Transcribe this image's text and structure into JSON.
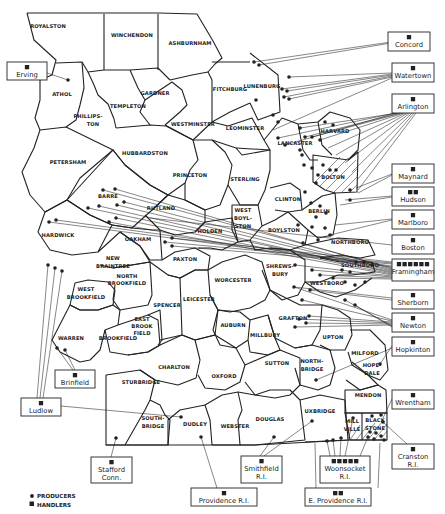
{
  "map": {
    "title": "",
    "towns": [
      {
        "name": "ROYALSTON",
        "x": 48,
        "y": 28
      },
      {
        "name": "WINCHENDON",
        "x": 132,
        "y": 37
      },
      {
        "name": "ASHBURNHAM",
        "x": 190,
        "y": 45
      },
      {
        "name": "ATHOL",
        "x": 62,
        "y": 96
      },
      {
        "name": "GARDNER",
        "x": 155,
        "y": 95
      },
      {
        "name": "TEMPLETON",
        "x": 128,
        "y": 108
      },
      {
        "name": "PHILLIPS-",
        "x": 88,
        "y": 118
      },
      {
        "name": "TON",
        "x": 93,
        "y": 126
      },
      {
        "name": "FITCHBURG",
        "x": 230,
        "y": 91
      },
      {
        "name": "LUNENBURG",
        "x": 262,
        "y": 88
      },
      {
        "name": "WESTMINSTER",
        "x": 193,
        "y": 126
      },
      {
        "name": "LEOMINSTER",
        "x": 245,
        "y": 130
      },
      {
        "name": "HARVARD",
        "x": 335,
        "y": 133
      },
      {
        "name": "PETERSHAM",
        "x": 68,
        "y": 164
      },
      {
        "name": "HUBBARDSTON",
        "x": 145,
        "y": 155
      },
      {
        "name": "LANCASTER",
        "x": 295,
        "y": 145
      },
      {
        "name": "PRINCETON",
        "x": 190,
        "y": 177
      },
      {
        "name": "STERLING",
        "x": 245,
        "y": 181
      },
      {
        "name": "BOLTON",
        "x": 333,
        "y": 179
      },
      {
        "name": "BARRE",
        "x": 108,
        "y": 198
      },
      {
        "name": "RUTLAND",
        "x": 161,
        "y": 210
      },
      {
        "name": "CLINTON",
        "x": 288,
        "y": 201
      },
      {
        "name": "WEST",
        "x": 243,
        "y": 212
      },
      {
        "name": "BOYL-",
        "x": 243,
        "y": 220
      },
      {
        "name": "STON",
        "x": 243,
        "y": 228
      },
      {
        "name": "BERLIN",
        "x": 319,
        "y": 213
      },
      {
        "name": "HOLDEN",
        "x": 210,
        "y": 233
      },
      {
        "name": "BOYLSTON",
        "x": 284,
        "y": 232
      },
      {
        "name": "HARDWICK",
        "x": 58,
        "y": 237
      },
      {
        "name": "OAKHAM",
        "x": 138,
        "y": 241
      },
      {
        "name": "NORTHBORO",
        "x": 350,
        "y": 244
      },
      {
        "name": "NEW",
        "x": 113,
        "y": 260
      },
      {
        "name": "BRAINTREE",
        "x": 113,
        "y": 268
      },
      {
        "name": "PAXTON",
        "x": 185,
        "y": 261
      },
      {
        "name": "SHREWS-",
        "x": 280,
        "y": 268
      },
      {
        "name": "BURY",
        "x": 280,
        "y": 276
      },
      {
        "name": "SOUTHBORO",
        "x": 360,
        "y": 267
      },
      {
        "name": "NORTH",
        "x": 127,
        "y": 278
      },
      {
        "name": "BROOKFIELD",
        "x": 127,
        "y": 285
      },
      {
        "name": "WORCESTER",
        "x": 233,
        "y": 282
      },
      {
        "name": "WESTBORO",
        "x": 327,
        "y": 285
      },
      {
        "name": "WEST",
        "x": 86,
        "y": 291
      },
      {
        "name": "BROOKFIELD",
        "x": 86,
        "y": 299
      },
      {
        "name": "SPENCER",
        "x": 167,
        "y": 307
      },
      {
        "name": "LEICESTER",
        "x": 199,
        "y": 301
      },
      {
        "name": "GRAFTON",
        "x": 293,
        "y": 320
      },
      {
        "name": "EAST",
        "x": 142,
        "y": 321
      },
      {
        "name": "BROOK",
        "x": 142,
        "y": 328
      },
      {
        "name": "FIELD",
        "x": 142,
        "y": 335
      },
      {
        "name": "AUBURN",
        "x": 233,
        "y": 327
      },
      {
        "name": "UPTON",
        "x": 333,
        "y": 339
      },
      {
        "name": "WARREN",
        "x": 71,
        "y": 340
      },
      {
        "name": "BROOKFIELD",
        "x": 118,
        "y": 340
      },
      {
        "name": "MILLBURY",
        "x": 265,
        "y": 337
      },
      {
        "name": "MILFORD",
        "x": 365,
        "y": 355
      },
      {
        "name": "NORTH-",
        "x": 312,
        "y": 363
      },
      {
        "name": "BRIDGE",
        "x": 312,
        "y": 371
      },
      {
        "name": "HOPE-",
        "x": 372,
        "y": 367
      },
      {
        "name": "DALE",
        "x": 372,
        "y": 375
      },
      {
        "name": "CHARLTON",
        "x": 174,
        "y": 369
      },
      {
        "name": "SUTTON",
        "x": 277,
        "y": 365
      },
      {
        "name": "OXFORD",
        "x": 224,
        "y": 378
      },
      {
        "name": "STURBRIDGE",
        "x": 141,
        "y": 384
      },
      {
        "name": "MENDON",
        "x": 368,
        "y": 397
      },
      {
        "name": "UXBRIDGE",
        "x": 320,
        "y": 413
      },
      {
        "name": "SOUTH-",
        "x": 153,
        "y": 420
      },
      {
        "name": "BRIDGE",
        "x": 153,
        "y": 428
      },
      {
        "name": "DUDLEY",
        "x": 195,
        "y": 426
      },
      {
        "name": "WEBSTER",
        "x": 235,
        "y": 428
      },
      {
        "name": "DOUGLAS",
        "x": 270,
        "y": 421
      },
      {
        "name": "MILL",
        "x": 352,
        "y": 423
      },
      {
        "name": "VILLE",
        "x": 352,
        "y": 431
      },
      {
        "name": "BLACK",
        "x": 375,
        "y": 422
      },
      {
        "name": "STONE",
        "x": 375,
        "y": 430
      }
    ],
    "handlers": [
      {
        "name": "Concord",
        "line2": "",
        "squares": 1,
        "x": 388,
        "y": 32,
        "w": 42,
        "h": 19
      },
      {
        "name": "Erving",
        "line2": "",
        "squares": 1,
        "x": 7,
        "y": 62,
        "w": 40,
        "h": 18
      },
      {
        "name": "Watertown",
        "line2": "",
        "squares": 1,
        "x": 392,
        "y": 63,
        "w": 42,
        "h": 19
      },
      {
        "name": "Arlington",
        "line2": "",
        "squares": 1,
        "x": 392,
        "y": 94,
        "w": 42,
        "h": 19
      },
      {
        "name": "Maynard",
        "line2": "",
        "squares": 1,
        "x": 392,
        "y": 164,
        "w": 42,
        "h": 19
      },
      {
        "name": "Hudson",
        "line2": "",
        "squares": 2,
        "x": 392,
        "y": 187,
        "w": 42,
        "h": 19
      },
      {
        "name": "Marlboro",
        "line2": "",
        "squares": 1,
        "x": 392,
        "y": 210,
        "w": 42,
        "h": 19
      },
      {
        "name": "Boston",
        "line2": "",
        "squares": 1,
        "x": 392,
        "y": 235,
        "w": 42,
        "h": 19
      },
      {
        "name": "Framingham",
        "line2": "",
        "squares": 6,
        "x": 392,
        "y": 259,
        "w": 42,
        "h": 22
      },
      {
        "name": "Sherborn",
        "line2": "",
        "squares": 1,
        "x": 392,
        "y": 290,
        "w": 42,
        "h": 19
      },
      {
        "name": "Newton",
        "line2": "",
        "squares": 1,
        "x": 392,
        "y": 313,
        "w": 42,
        "h": 19
      },
      {
        "name": "Hopkinton",
        "line2": "",
        "squares": 1,
        "x": 392,
        "y": 337,
        "w": 42,
        "h": 19
      },
      {
        "name": "Wrentham",
        "line2": "",
        "squares": 1,
        "x": 392,
        "y": 390,
        "w": 42,
        "h": 19
      },
      {
        "name": "Cranston",
        "line2": "R.I.",
        "squares": 1,
        "x": 392,
        "y": 444,
        "w": 42,
        "h": 25
      },
      {
        "name": "Brinfield",
        "line2": "",
        "squares": 1,
        "x": 55,
        "y": 370,
        "w": 40,
        "h": 18
      },
      {
        "name": "Ludlow",
        "line2": "",
        "squares": 1,
        "x": 21,
        "y": 398,
        "w": 40,
        "h": 18
      },
      {
        "name": "Stafford",
        "line2": "Conn.",
        "squares": 1,
        "x": 91,
        "y": 457,
        "w": 41,
        "h": 26
      },
      {
        "name": "Smithfield",
        "line2": "R.I.",
        "squares": 1,
        "x": 241,
        "y": 456,
        "w": 41,
        "h": 27
      },
      {
        "name": "Woonsocket",
        "line2": "R.I.",
        "squares": 5,
        "x": 320,
        "y": 456,
        "w": 50,
        "h": 27
      },
      {
        "name": "Providence R.I.",
        "line2": "",
        "squares": 1,
        "x": 191,
        "y": 488,
        "w": 66,
        "h": 18
      },
      {
        "name": "E. Providence R.I.",
        "line2": "",
        "squares": 2,
        "x": 305,
        "y": 488,
        "w": 66,
        "h": 18
      }
    ]
  },
  "legend": {
    "producers_label": "PRODUCERS",
    "handlers_label": "HANDLERS",
    "producer_symbol": "dot",
    "handler_symbol": "square"
  },
  "colors": {
    "ink": "#222222",
    "paper": "#ffffff"
  }
}
